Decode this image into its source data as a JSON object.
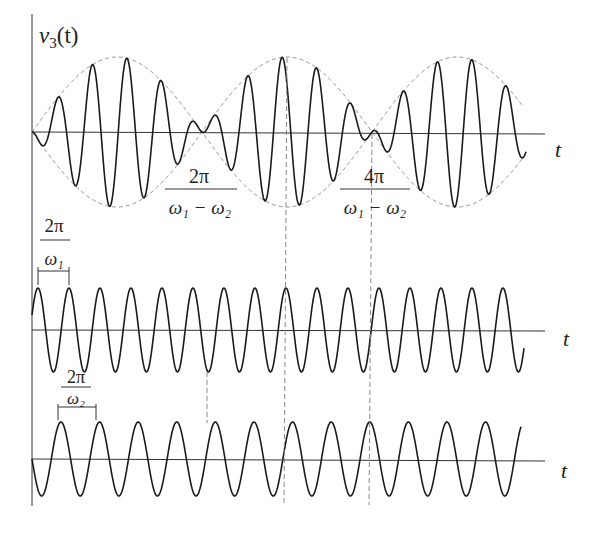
{
  "figure": {
    "colors": {
      "stroke": "#1a1a1a",
      "axis": "#333333",
      "dashed": "#888888"
    },
    "top_plot": {
      "y_label": "v",
      "y_label_sub": "3",
      "y_label_arg": "(t)",
      "x_label": "t",
      "annotation_1": {
        "numerator": "2π",
        "denominator": "ω₁ − ω₂"
      },
      "annotation_2": {
        "numerator": "4π",
        "denominator": "ω₁ − ω₂"
      }
    },
    "middle_plot": {
      "x_label": "t",
      "period_label": {
        "numerator": "2π",
        "denominator": "ω₁"
      }
    },
    "bottom_plot": {
      "x_label": "t",
      "period_label": {
        "numerator": "2π",
        "denominator": "ω₂"
      }
    }
  },
  "chart_data": {
    "type": "line",
    "title": "",
    "series": [
      {
        "name": "v3(t)",
        "panel": "top",
        "form": "beat envelope",
        "beat_nodes_x_px": [
          32,
          202,
          372
        ],
        "envelope_peak_x_px": [
          117,
          287,
          457
        ],
        "axis_y_px": 132,
        "amplitude_px": 75
      },
      {
        "name": "sin(ω1 t)",
        "panel": "middle",
        "period_px": 31,
        "axis_y_px": 330,
        "amplitude_px": 42
      },
      {
        "name": "sin(ω2 t)",
        "panel": "bottom",
        "period_px": 38.6,
        "axis_y_px": 459,
        "amplitude_px": 37
      }
    ],
    "annotations": [
      "2π/(ω1−ω2)",
      "4π/(ω1−ω2)",
      "2π/ω1",
      "2π/ω2"
    ],
    "xlabel": "t",
    "ylabel": "v3(t)"
  }
}
